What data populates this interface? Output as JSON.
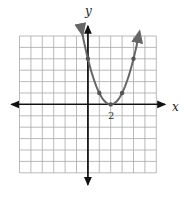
{
  "chart_data": {
    "type": "line",
    "title": "",
    "function": "y = (x - 2)^2",
    "xlabel": "x",
    "ylabel": "y",
    "x_tick_labels": [
      {
        "value": 2,
        "label": "2"
      }
    ],
    "grid": true,
    "xlim": [
      -6,
      6
    ],
    "ylim": [
      -6,
      6
    ],
    "points": [
      {
        "x": 0,
        "y": 4
      },
      {
        "x": 1,
        "y": 1
      },
      {
        "x": 2,
        "y": 0
      },
      {
        "x": 3,
        "y": 1
      },
      {
        "x": 4,
        "y": 4
      }
    ],
    "curve_x_range": [
      -0.5,
      4.5
    ],
    "curve_color": "#666666",
    "legend": null
  },
  "labels": {
    "x_axis": "x",
    "y_axis": "y",
    "vertex_tick": "2"
  }
}
